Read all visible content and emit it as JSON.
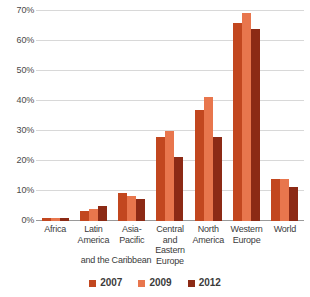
{
  "chart_data": {
    "type": "bar",
    "title": "",
    "xlabel": "",
    "ylabel": "",
    "ylim": [
      0,
      70
    ],
    "grid": true,
    "legend_position": "bottom",
    "categories": [
      "Africa",
      "Latin America and the Caribbean",
      "Asia-Pacific",
      "Central and Eastern Europe",
      "North America",
      "Western Europe",
      "World"
    ],
    "series": [
      {
        "name": "2007",
        "color": "#C2471F",
        "values": [
          1,
          3.5,
          9.5,
          28,
          37,
          66,
          14
        ]
      },
      {
        "name": "2009",
        "color": "#E8764D",
        "values": [
          1,
          4,
          8.5,
          30,
          41.5,
          69.5,
          14
        ]
      },
      {
        "name": "2012",
        "color": "#8C2A15",
        "values": [
          1,
          5,
          7.5,
          21.5,
          28,
          64,
          11.5
        ]
      }
    ],
    "y_ticks": [
      {
        "value": 70,
        "label": "70%"
      },
      {
        "value": 60,
        "label": "60%"
      },
      {
        "value": 50,
        "label": "50%"
      },
      {
        "value": 40,
        "label": "40%"
      },
      {
        "value": 30,
        "label": "30%"
      },
      {
        "value": 20,
        "label": "20%"
      },
      {
        "value": 10,
        "label": "10%"
      },
      {
        "value": 0,
        "label": "0%"
      }
    ],
    "x_tick_lines": [
      [
        "Africa"
      ],
      [
        "Latin",
        "America"
      ],
      [
        "Asia-",
        "Pacific"
      ],
      [
        "Central",
        "and",
        "Eastern",
        "Europe"
      ],
      [
        "North",
        "America"
      ],
      [
        "Western",
        "Europe"
      ],
      [
        "World"
      ]
    ],
    "x_extra_line": "and the Caribbean"
  },
  "axis": {
    "y_labels": [
      "70%",
      "60%",
      "50%",
      "40%",
      "30%",
      "20%",
      "10%",
      "0%"
    ]
  },
  "legend": {
    "items": [
      {
        "label": "2007",
        "color": "#C2471F"
      },
      {
        "label": "2009",
        "color": "#E8764D"
      },
      {
        "label": "2012",
        "color": "#8C2A15"
      }
    ]
  },
  "colors": {
    "series_2007": "#C2471F",
    "series_2009": "#E8764D",
    "series_2012": "#8C2A15",
    "gridline": "#d8d8d8",
    "baseline": "#9a9a9a",
    "text": "#3b3b3b",
    "background": "#ffffff"
  }
}
